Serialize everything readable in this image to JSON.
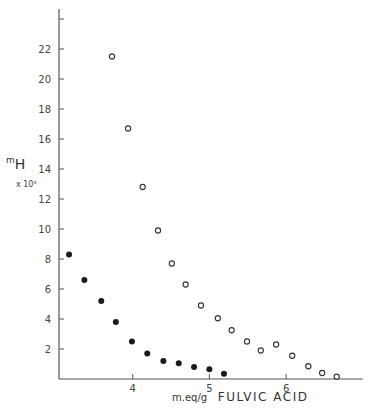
{
  "chart_data": {
    "type": "scatter",
    "title": "",
    "xlabel": "m.eq/g FULVIC ACID",
    "ylabel": "mH x 10^5",
    "ylabel_main": "H",
    "ylabel_prefix": "m",
    "ylabel_scale": "x 10⁵",
    "xlabel_unit": "m.eq/g",
    "xlabel_text": "FULVIC ACID",
    "xlim": [
      3.0,
      7.0
    ],
    "ylim": [
      0,
      24.5
    ],
    "x_ticks": [
      4,
      5,
      6
    ],
    "y_ticks": [
      2,
      4,
      6,
      8,
      10,
      12,
      14,
      16,
      18,
      20,
      22,
      24
    ],
    "y_tick_labels": [
      "2",
      "4",
      "6",
      "8",
      "10",
      "12",
      "14",
      "16",
      "18",
      "20",
      "22",
      ""
    ],
    "grid": false,
    "legend": null,
    "series": [
      {
        "name": "filled circles",
        "marker": "filled",
        "x": [
          3.17,
          3.37,
          3.59,
          3.78,
          3.99,
          4.19,
          4.4,
          4.6,
          4.8,
          5.0,
          5.19
        ],
        "y": [
          8.3,
          6.6,
          5.2,
          3.8,
          2.5,
          1.7,
          1.2,
          1.05,
          0.8,
          0.65,
          0.35
        ]
      },
      {
        "name": "open circles",
        "marker": "open",
        "x": [
          3.73,
          3.94,
          4.13,
          4.33,
          4.51,
          4.69,
          4.89,
          5.11,
          5.29,
          5.49,
          5.67,
          5.87,
          6.08,
          6.29,
          6.47,
          6.66
        ],
        "y": [
          21.5,
          16.7,
          12.8,
          9.9,
          7.7,
          6.3,
          4.9,
          4.05,
          3.25,
          2.5,
          1.9,
          2.3,
          1.55,
          0.85,
          0.4,
          0.15
        ]
      }
    ]
  }
}
